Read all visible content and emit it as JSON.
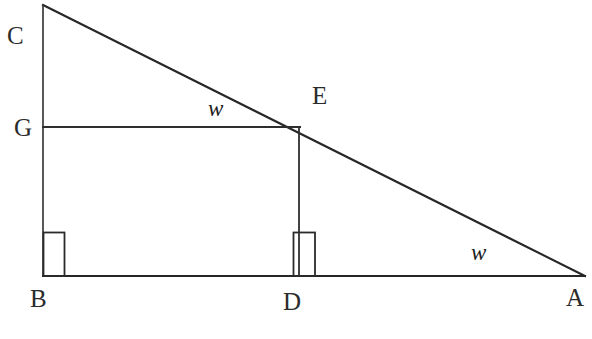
{
  "figure": {
    "kind": "geometry-diagram",
    "background_color": "#ffffff",
    "stroke_color": "#262626",
    "points": {
      "A": {
        "label": "A",
        "x": 585,
        "y": 276
      },
      "B": {
        "label": "B",
        "x": 43,
        "y": 276
      },
      "C": {
        "label": "C",
        "x": 43,
        "y": 5
      },
      "D": {
        "label": "D",
        "x": 299,
        "y": 276
      },
      "E": {
        "label": "E",
        "x": 299,
        "y": 127
      },
      "G": {
        "label": "G",
        "x": 43,
        "y": 127
      }
    },
    "segments": [
      {
        "name": "hypotenuse-CA",
        "from": "C",
        "to": "A"
      },
      {
        "name": "leg-CB",
        "from": "C",
        "to": "B"
      },
      {
        "name": "leg-BA",
        "from": "B",
        "to": "A"
      },
      {
        "name": "segment-GE",
        "from": "G",
        "to": "E"
      },
      {
        "name": "segment-ED",
        "from": "E",
        "to": "D"
      }
    ],
    "right_angles": [
      {
        "name": "right-angle-at-B",
        "at": "B",
        "x": 43,
        "y": 232,
        "width": 21,
        "height": 44
      },
      {
        "name": "right-angle-at-D",
        "at": "D",
        "x": 293,
        "y": 232,
        "width": 22,
        "height": 44
      }
    ],
    "angle_labels": {
      "upper": "w",
      "lower": "w"
    }
  },
  "labels": {
    "C": "C",
    "G": "G",
    "E": "E",
    "B": "B",
    "D": "D",
    "A": "A",
    "w_upper": "w",
    "w_lower": "w"
  }
}
